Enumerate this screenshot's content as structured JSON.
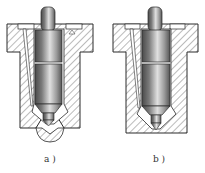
{
  "figure": {
    "type": "technical-cross-section",
    "panels": [
      {
        "id": "a",
        "label": "a )",
        "variant": "nozzle with spray-hole bulb"
      },
      {
        "id": "b",
        "label": "b )",
        "variant": "plain pintle-type nozzle"
      }
    ]
  },
  "colors": {
    "outline": "#2a2a2a",
    "hatch": "#555555",
    "needle_dark": "#5a5a5a",
    "needle_light": "#d8d8d8",
    "background": "#ffffff"
  }
}
